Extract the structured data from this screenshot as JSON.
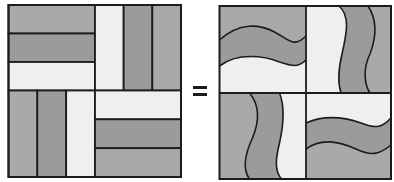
{
  "figure": {
    "operator": "=",
    "colors": {
      "outer_strip": "#a9a9a9",
      "middle_strip": "#9b9b9b",
      "light_strip": "#efefef",
      "outline": "#1c1c1c",
      "background": "#ffffff"
    },
    "left_block": {
      "name": "straight-strip block",
      "quadrants": [
        {
          "position": "top-left",
          "orientation": "horizontal",
          "strips": [
            "outer",
            "middle",
            "light"
          ]
        },
        {
          "position": "top-right",
          "orientation": "vertical",
          "strips": [
            "light",
            "middle",
            "outer"
          ]
        },
        {
          "position": "bottom-left",
          "orientation": "vertical",
          "strips": [
            "outer",
            "middle",
            "light"
          ]
        },
        {
          "position": "bottom-right",
          "orientation": "horizontal",
          "strips": [
            "light",
            "middle",
            "outer"
          ]
        }
      ]
    },
    "right_block": {
      "name": "curved-strip block",
      "quadrants": [
        {
          "position": "top-left",
          "orientation": "horizontal-wavy",
          "strips": [
            "outer",
            "middle",
            "light"
          ]
        },
        {
          "position": "top-right",
          "orientation": "vertical-wavy",
          "strips": [
            "light",
            "middle",
            "outer"
          ]
        },
        {
          "position": "bottom-left",
          "orientation": "vertical-wavy",
          "strips": [
            "outer",
            "middle",
            "light"
          ]
        },
        {
          "position": "bottom-right",
          "orientation": "horizontal-wavy",
          "strips": [
            "light",
            "middle",
            "outer"
          ]
        }
      ]
    }
  }
}
